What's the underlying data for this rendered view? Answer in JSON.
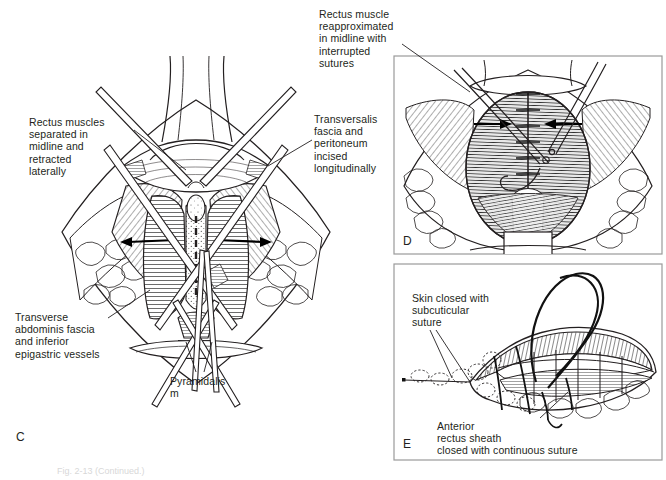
{
  "figure": {
    "type": "medical-surgical-illustration",
    "background_color": "#ffffff",
    "ink_color": "#231f20"
  },
  "panels": [
    {
      "id": "C",
      "letter": "C",
      "title": "Rectus muscles separated and transversalis fascia incised",
      "bordered": false
    },
    {
      "id": "D",
      "letter": "D",
      "title": "Rectus muscle reapproximated with interrupted sutures",
      "bordered": true
    },
    {
      "id": "E",
      "letter": "E",
      "title": "Skin and anterior rectus sheath closure",
      "bordered": true
    }
  ],
  "labels": {
    "rectus_separated": "Rectus muscles\nseparated in\nmidline and\nretracted\nlaterally",
    "transversalis": "Transversalis\nfascia and\nperitoneum\nincised\nlongitudinally",
    "transverse_abdominis": "Transverse\nabdominis fascia\nand inferior\nepigastric vessels",
    "pyramidalis": "Pyramidalis\nm",
    "rectus_reapproximated": "Rectus muscle\nreapproximated\nin midline with\ninterrupted\nsutures",
    "skin_closed": "Skin closed with\nsubcuticular\nsuture",
    "anterior_sheath": "Anterior\nrectus sheath\nclosed with continuous suture"
  },
  "caption": {
    "text": "Fig. 2-13  (Continued.)",
    "truncated": true
  },
  "colors": {
    "ink": "#231f20",
    "panel_border": "#9a9a9a",
    "muscle_shade": "#6f6f6f",
    "fat_shade": "#bdbdbd",
    "white": "#ffffff"
  }
}
